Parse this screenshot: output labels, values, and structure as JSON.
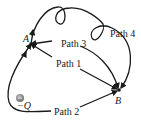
{
  "diagram": {
    "points": {
      "A": {
        "label": "A",
        "x": 31,
        "y": 44
      },
      "B": {
        "label": "B",
        "x": 119,
        "y": 90
      }
    },
    "charge": {
      "label": "−Q",
      "x": 20,
      "y": 98,
      "color": "#8a8a8a"
    },
    "paths": [
      {
        "id": "path1",
        "label": "Path 1"
      },
      {
        "id": "path2",
        "label": "Path 2"
      },
      {
        "id": "path3",
        "label": "Path 3"
      },
      {
        "id": "path4",
        "label": "Path 4"
      }
    ],
    "stroke_color": "#1a1a1a"
  }
}
